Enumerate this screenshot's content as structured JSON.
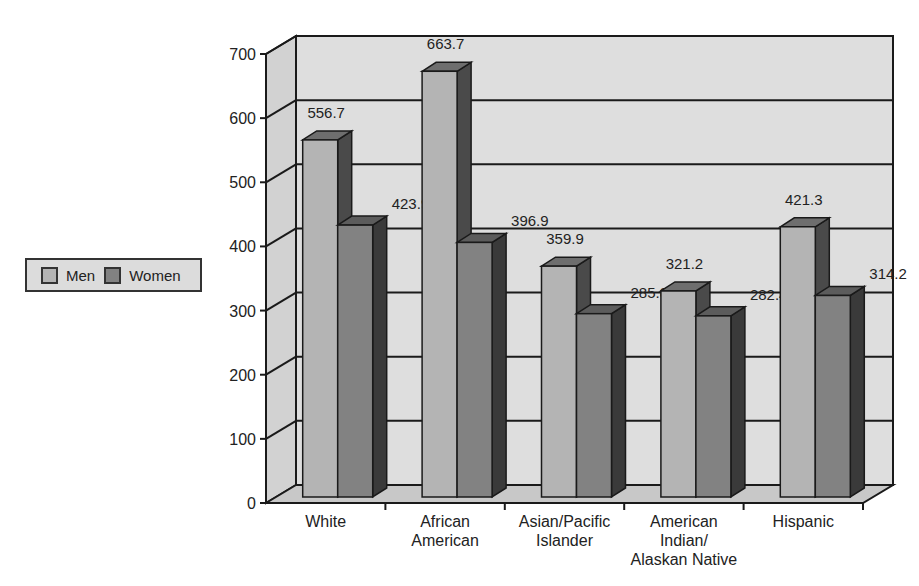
{
  "chart_data": {
    "type": "bar",
    "style": "3d-clustered-column",
    "title": "",
    "xlabel": "",
    "ylabel": "",
    "categories": [
      "White",
      "African American",
      "Asian/Pacific Islander",
      "American Indian/ Alaskan Native",
      "Hispanic"
    ],
    "category_label_lines": [
      [
        "White"
      ],
      [
        "African",
        "American"
      ],
      [
        "Asian/Pacific",
        "Islander"
      ],
      [
        "American",
        "Indian/",
        "Alaskan Native"
      ],
      [
        "Hispanic"
      ]
    ],
    "series": [
      {
        "name": "Men",
        "values": [
          556.7,
          663.7,
          359.9,
          321.2,
          421.3
        ],
        "color": "#b4b4b4"
      },
      {
        "name": "Women",
        "values": [
          423.9,
          396.9,
          285.8,
          282.4,
          314.2
        ],
        "color": "#828282"
      }
    ],
    "ylim": [
      0,
      700
    ],
    "yticks": [
      0,
      100,
      200,
      300,
      400,
      500,
      600,
      700
    ],
    "grid": true,
    "legend_position": "left",
    "data_labels": true
  },
  "legend": {
    "items": [
      {
        "label": "Men",
        "color": "#b4b4b4"
      },
      {
        "label": "Women",
        "color": "#828282"
      }
    ]
  }
}
